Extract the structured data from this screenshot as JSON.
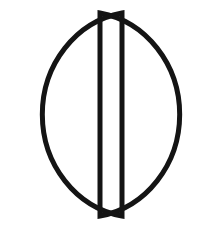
{
  "canvas": {
    "width": 221,
    "height": 231,
    "background_color": "#ffffff",
    "title": "Split Circle Glyph"
  },
  "figure": {
    "name": "split-circle",
    "stroke_color": "#141414",
    "fill": "none",
    "stroke_width": 5,
    "circle": {
      "center_x": 110.5,
      "center_y": 114.5,
      "radius_x": 96,
      "radius_y": 103,
      "left_edge_x": 14,
      "right_edge_x": 207,
      "top_edge_y": 11,
      "bottom_edge_y": 218
    },
    "gap": {
      "left_line_x": 100,
      "right_line_x": 122,
      "width": 18,
      "top_y": 13,
      "bottom_y": 216
    },
    "parts": [
      {
        "name": "left-half-disc",
        "side": "left",
        "arc_bulge": "left",
        "chord_x": 100,
        "chord_top_y": 13,
        "chord_bottom_y": 216
      },
      {
        "name": "right-half-disc",
        "side": "right",
        "arc_bulge": "right",
        "chord_x": 122,
        "chord_top_y": 13,
        "chord_bottom_y": 216
      }
    ]
  }
}
